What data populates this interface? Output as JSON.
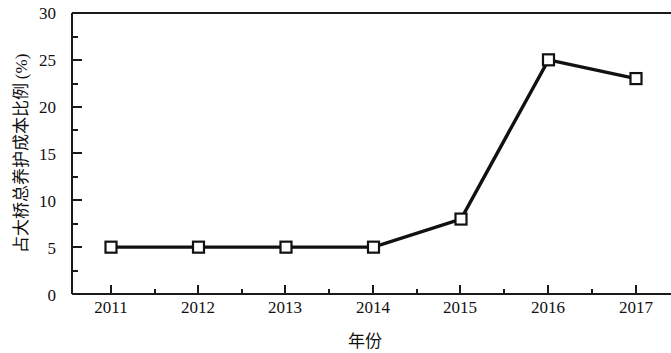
{
  "chart_data": {
    "type": "line",
    "title": "",
    "subtitle": "",
    "xlabel": "年份",
    "ylabel": "占大桥总养护成本比例 (%)",
    "categories": [
      "2011",
      "2012",
      "2013",
      "2014",
      "2015",
      "2016",
      "2017"
    ],
    "x": [
      2011,
      2012,
      2013,
      2014,
      2015,
      2016,
      2017
    ],
    "values": [
      5,
      5,
      5,
      5,
      8,
      25,
      23
    ],
    "series": [
      {
        "name": "占大桥总养护成本比例",
        "values": [
          5,
          5,
          5,
          5,
          8,
          25,
          23
        ],
        "marker": "open-square",
        "marker_fill": "#ffffff",
        "line_color": "#111111",
        "line_width": 3
      }
    ],
    "xlim": [
      2010.5,
      2017.4
    ],
    "ylim": [
      0,
      30
    ],
    "yticks": [
      0,
      5,
      10,
      15,
      20,
      25,
      30
    ],
    "ytick_labels": [
      "0",
      "5",
      "10",
      "15",
      "20",
      "25",
      "30"
    ],
    "yminor_ticks": [
      2.5,
      7.5,
      12.5,
      17.5,
      22.5,
      27.5
    ],
    "xticks": [
      2011,
      2012,
      2013,
      2014,
      2015,
      2016,
      2017
    ],
    "xtick_labels": [
      "2011",
      "2012",
      "2013",
      "2014",
      "2015",
      "2016",
      "2017"
    ],
    "xminor_ticks": [
      2011.5,
      2012.5,
      2013.5,
      2014.5,
      2015.5,
      2016.5
    ],
    "grid": false,
    "legend": false,
    "legend_position": "none",
    "axis_color": "#1a1a1a",
    "background": "#ffffff"
  },
  "axes": {
    "y_tick_labels": [
      "30",
      "25",
      "20",
      "15",
      "10",
      "5",
      "0"
    ],
    "x_tick_labels": [
      "2011",
      "2012",
      "2013",
      "2014",
      "2015",
      "2016",
      "2017"
    ],
    "y_axis_title": "占大桥总养护成本比例 (%)",
    "x_axis_title": "年份"
  }
}
